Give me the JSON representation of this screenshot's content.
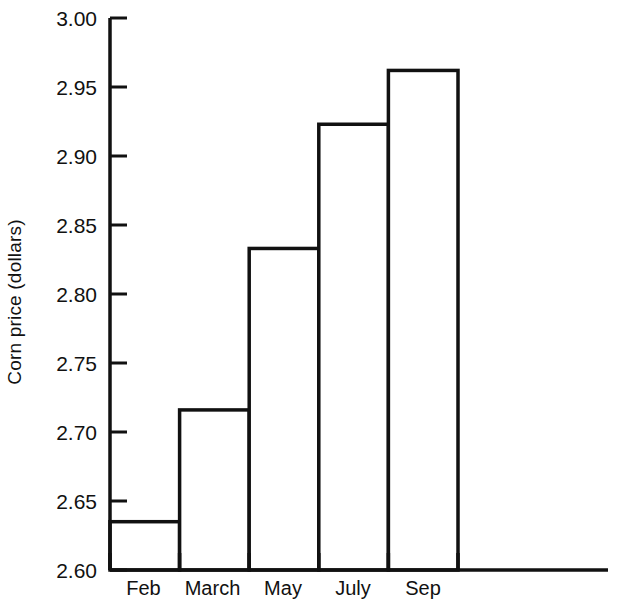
{
  "chart_data": {
    "type": "bar",
    "title": "",
    "xlabel": "",
    "ylabel": "Corn price (dollars)",
    "categories": [
      "Feb",
      "March",
      "May",
      "July",
      "Sep"
    ],
    "values": [
      2.635,
      2.716,
      2.833,
      2.923,
      2.962
    ],
    "ylim": [
      2.6,
      3.0
    ],
    "ytick_labels": [
      "3.00",
      "2.95",
      "2.90",
      "2.85",
      "2.80",
      "2.75",
      "2.70",
      "2.65",
      "2.60"
    ],
    "ytick_values": [
      3.0,
      2.95,
      2.9,
      2.85,
      2.8,
      2.75,
      2.7,
      2.65,
      2.6
    ],
    "grid": false,
    "legend": null,
    "series": [
      {
        "name": "Corn price",
        "values": [
          2.635,
          2.716,
          2.833,
          2.923,
          2.962
        ]
      }
    ],
    "style": {
      "bar_fill": "#ffffff",
      "bar_stroke": "#111111",
      "axis_color": "#111111",
      "background": "#ffffff"
    }
  },
  "axes": {
    "y_label_text": "Corn price (dollars)"
  }
}
